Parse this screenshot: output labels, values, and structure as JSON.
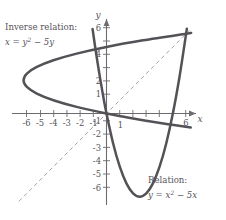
{
  "figure": {
    "axis_x_name": "x",
    "axis_y_name": "y",
    "colors": {
      "curve": "#555257",
      "axis": "#6e6b70",
      "dashed": "#9a979c",
      "text": "#57545a"
    },
    "x_ticks_labeled": [
      "-6",
      "-5",
      "-4",
      "-3",
      "-2",
      "-1",
      "1",
      "6"
    ],
    "y_ticks_labeled": [
      "6",
      "4",
      "2",
      "1",
      "-1",
      "-2",
      "-3",
      "-4",
      "-5",
      "-6"
    ],
    "annotations": {
      "inverse_title": "Inverse relation:",
      "inverse_eq_lhs": "x = y",
      "inverse_eq_sup": "2",
      "inverse_eq_rhs": " − 5y",
      "relation_title": "Relation:",
      "relation_eq_lhs": "y = x",
      "relation_eq_sup": "2",
      "relation_eq_rhs": " − 5x"
    }
  },
  "chart_data": {
    "type": "line",
    "title": "",
    "xlabel": "x",
    "ylabel": "y",
    "xlim": [
      -7.6,
      7.2
    ],
    "ylim": [
      -7.2,
      7.0
    ],
    "grid": false,
    "legend": "none",
    "xticks": [
      -6,
      -5,
      -4,
      -3,
      -2,
      -1,
      1,
      2,
      3,
      4,
      5,
      6
    ],
    "xticklabels": [
      "-6",
      "-5",
      "-4",
      "-3",
      "-2",
      "-1",
      "1",
      "",
      "",
      "",
      "",
      "6"
    ],
    "yticks": [
      -6,
      -5,
      -4,
      -3,
      -2,
      -1,
      1,
      2,
      3,
      4,
      5,
      6
    ],
    "yticklabels": [
      "-6",
      "-5",
      "-4",
      "-3",
      "-2",
      "-1",
      "1",
      "2",
      "",
      "4",
      "",
      "6"
    ],
    "series": [
      {
        "name": "Relation: y = x^2 - 5x",
        "type": "parabola",
        "equation": "y = x^2 - 5x",
        "vertex": [
          2.5,
          -6.25
        ],
        "roots": [
          0,
          5
        ],
        "domain": [
          -1.05,
          6.05
        ],
        "style": "solid",
        "color": "#555257",
        "points": [
          [
            -1.05,
            6.35
          ],
          [
            -0.8,
            4.64
          ],
          [
            -0.5,
            2.75
          ],
          [
            -0.25,
            1.31
          ],
          [
            0,
            0
          ],
          [
            0.5,
            -2.25
          ],
          [
            1,
            -4
          ],
          [
            1.5,
            -5.25
          ],
          [
            2,
            -6
          ],
          [
            2.5,
            -6.25
          ],
          [
            3,
            -6
          ],
          [
            3.5,
            -5.25
          ],
          [
            4,
            -4
          ],
          [
            4.5,
            -2.25
          ],
          [
            5,
            0
          ],
          [
            5.5,
            2.75
          ],
          [
            6,
            6
          ],
          [
            6.05,
            6.35
          ]
        ]
      },
      {
        "name": "Inverse relation: x = y^2 - 5y",
        "type": "parabola-horizontal",
        "equation": "x = y^2 - 5y",
        "vertex": [
          -6.25,
          2.5
        ],
        "roots": [
          0,
          5
        ],
        "domain_y": [
          -1.05,
          6.05
        ],
        "style": "solid",
        "color": "#555257",
        "points": [
          [
            6.35,
            -1.05
          ],
          [
            4.64,
            -0.8
          ],
          [
            2.75,
            -0.5
          ],
          [
            1.31,
            -0.25
          ],
          [
            0,
            0
          ],
          [
            -2.25,
            0.5
          ],
          [
            -4,
            1
          ],
          [
            -5.25,
            1.5
          ],
          [
            -6,
            2
          ],
          [
            -6.25,
            2.5
          ],
          [
            -6,
            3
          ],
          [
            -5.25,
            3.5
          ],
          [
            -4,
            4
          ],
          [
            -2.25,
            4.5
          ],
          [
            0,
            5
          ],
          [
            2.75,
            5.5
          ],
          [
            6,
            6
          ],
          [
            6.35,
            6.05
          ]
        ]
      },
      {
        "name": "Line of symmetry y = x",
        "type": "line",
        "equation": "y = x",
        "style": "dashed",
        "color": "#9a979c",
        "points": [
          [
            -6.6,
            -6.6
          ],
          [
            6.4,
            6.4
          ]
        ]
      }
    ],
    "annotations": [
      {
        "text": "Inverse relation: x = y^2 - 5y",
        "x": -7.3,
        "y": 6.4
      },
      {
        "text": "Relation: y = x^2 - 5x",
        "x": 2.3,
        "y": -5.4
      }
    ]
  }
}
